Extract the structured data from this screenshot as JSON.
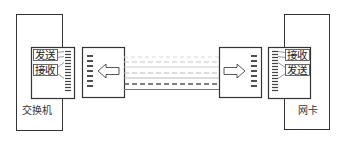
{
  "diagram": {
    "left_device": {
      "label": "交换机",
      "ports": {
        "top": "发送",
        "bottom": "接收"
      }
    },
    "right_device": {
      "label": "网卡",
      "ports": {
        "top": "接收",
        "bottom": "发送"
      }
    },
    "left_connector": {
      "arrow": "left-arrow-icon"
    },
    "right_connector": {
      "arrow": "right-arrow-icon"
    },
    "cable": {
      "lines": 6
    },
    "colors": {
      "stroke": "#333333",
      "cable_light": "#cfcfcf",
      "cable_dark": "#555555"
    }
  }
}
